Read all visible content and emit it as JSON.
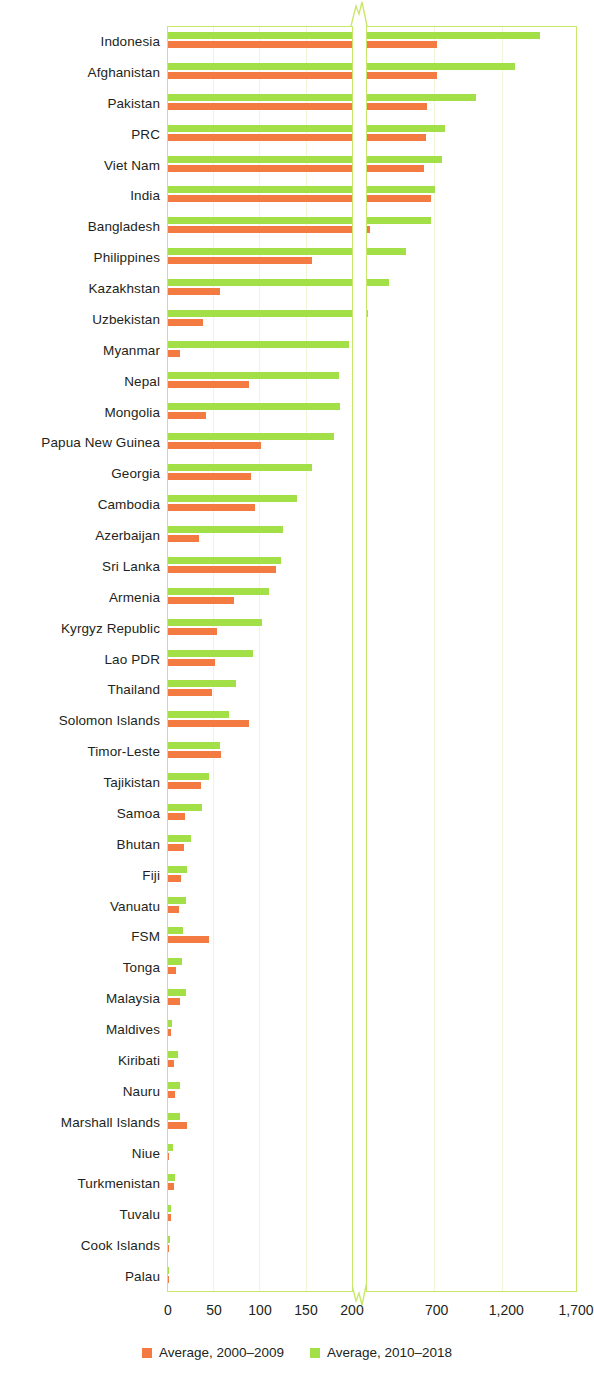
{
  "chart_data": {
    "type": "bar",
    "orientation": "horizontal",
    "title": "",
    "subtitle": "",
    "xlabel": "",
    "ylabel": "",
    "grid": true,
    "legend_position": "bottom",
    "broken_axis": true,
    "axis_segments": [
      {
        "pixel_from": 168,
        "pixel_to": 352,
        "value_from": 0,
        "value_to": 200
      },
      {
        "pixel_from": 367,
        "pixel_to": 576,
        "value_from": 200,
        "value_to": 1700
      }
    ],
    "xticks": [
      0,
      50,
      100,
      150,
      200,
      700,
      1200,
      1700
    ],
    "xtick_labels": [
      "0",
      "50",
      "100",
      "150",
      "200",
      "700",
      "1,200",
      "1,700"
    ],
    "colors": {
      "series1": "#f37b41",
      "series2": "#a3e048",
      "grid": "#f0f5d8",
      "frame": "#c8e86a"
    },
    "categories": [
      "Indonesia",
      "Afghanistan",
      "Pakistan",
      "PRC",
      "Viet Nam",
      "India",
      "Bangladesh",
      "Philippines",
      "Kazakhstan",
      "Uzbekistan",
      "Myanmar",
      "Nepal",
      "Mongolia",
      "Papua New Guinea",
      "Georgia",
      "Cambodia",
      "Azerbaijan",
      "Sri Lanka",
      "Armenia",
      "Kyrgyz Republic",
      "Lao PDR",
      "Thailand",
      "Solomon Islands",
      "Timor-Leste",
      "Tajikistan",
      "Samoa",
      "Bhutan",
      "Fiji",
      "Vanuatu",
      "FSM",
      "Tonga",
      "Malaysia",
      "Maldives",
      "Kiribati",
      "Nauru",
      "Marshall Islands",
      "Niue",
      "Turkmenistan",
      "Tuvalu",
      "Cook Islands",
      "Palau"
    ],
    "series": [
      {
        "name": "Average, 2000-2009",
        "color": "#f37b41",
        "values": [
          700,
          705,
          630,
          620,
          610,
          660,
          225,
          157,
          56,
          38,
          13,
          88,
          41,
          101,
          90,
          95,
          34,
          117,
          72,
          53,
          51,
          48,
          88,
          58,
          36,
          19,
          17,
          14,
          12,
          45,
          9,
          13,
          3,
          7,
          8,
          21,
          1.5,
          6,
          3,
          1.5,
          0.8
        ]
      },
      {
        "name": "Average, 2010-2018",
        "color": "#a3e048",
        "values": [
          1440,
          1260,
          980,
          760,
          735,
          690,
          660,
          480,
          355,
          205,
          197,
          186,
          187,
          180,
          156,
          140,
          125,
          123,
          110,
          102,
          92,
          74,
          66,
          57,
          45,
          37,
          25,
          21,
          20,
          16,
          15,
          20,
          4,
          11,
          13,
          13,
          5,
          8,
          3,
          2,
          1.5
        ]
      }
    ]
  },
  "legend": {
    "items": [
      {
        "label": "Average, 2000–2009",
        "color": "#f37b41"
      },
      {
        "label": "Average, 2010–2018",
        "color": "#a3e048"
      }
    ]
  }
}
